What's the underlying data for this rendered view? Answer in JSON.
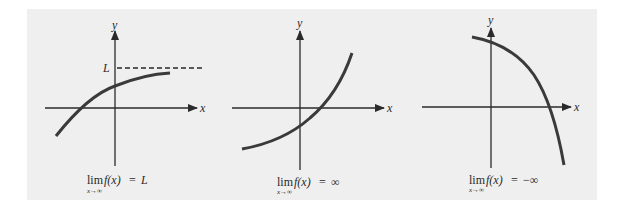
{
  "figure": {
    "background": "#efefef",
    "axis_color": "#2a2a2a",
    "curve_color": "#3a3a3a",
    "panels": [
      {
        "id": "limit-L",
        "y_axis_label": "y",
        "x_axis_label": "x",
        "asymptote_label": "L",
        "caption_lim": "lim",
        "caption_sub": "x→∞",
        "caption_expr": "f(x)",
        "caption_eq": "=",
        "caption_rhs": "L"
      },
      {
        "id": "limit-infinity",
        "y_axis_label": "y",
        "x_axis_label": "x",
        "caption_lim": "lim",
        "caption_sub": "x→∞",
        "caption_expr": "f(x)",
        "caption_eq": "=",
        "caption_rhs": "∞"
      },
      {
        "id": "limit-neg-infinity",
        "y_axis_label": "y",
        "x_axis_label": "x",
        "caption_lim": "lim",
        "caption_sub": "x→∞",
        "caption_expr": "f(x)",
        "caption_eq": "=",
        "caption_rhs": "−∞"
      }
    ]
  }
}
